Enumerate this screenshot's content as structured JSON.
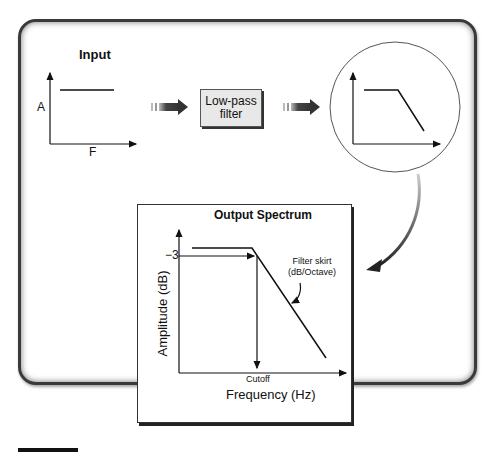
{
  "diagram": {
    "input_panel": {
      "title": "Input",
      "y_axis_label": "A",
      "x_axis_label": "F"
    },
    "filter_block": {
      "line1": "Low-pass",
      "line2": "filter"
    },
    "output_panel": {
      "title": "Output",
      "y_axis_label": "A",
      "x_axis_label": "F"
    },
    "spectrum_panel": {
      "title": "Output Spectrum",
      "y_axis_label": "Amplitude (dB)",
      "x_axis_label": "Frequency (Hz)",
      "marker_value": "−3",
      "cutoff_label": "Cutoff",
      "annotation_line1": "Filter skirt",
      "annotation_line2": "(dB/Octave)"
    },
    "colors": {
      "frame_border": "#3a3a3a",
      "filter_fill": "#e8e8e8",
      "arrow": "#333333",
      "line": "#111111"
    }
  }
}
